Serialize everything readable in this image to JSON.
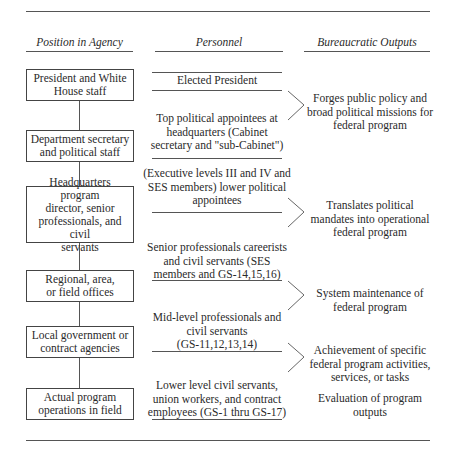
{
  "headers": {
    "position": "Position in Agency",
    "personnel": "Personnel",
    "outputs": "Bureaucratic Outputs"
  },
  "positions": [
    {
      "line1": "President and White",
      "line2": "House staff"
    },
    {
      "line1": "Department secretary",
      "line2": "and political staff"
    },
    {
      "line1": "Headquarters program",
      "line2": "director, senior",
      "line3": "professionals, and civil",
      "line4": "servants"
    },
    {
      "line1": "Regional, area,",
      "line2": "or field offices"
    },
    {
      "line1": "Local government or",
      "line2": "contract agencies"
    },
    {
      "line1": "Actual program",
      "line2": "operations in field"
    }
  ],
  "personnel": [
    {
      "line1": "Elected President"
    },
    {
      "line1": "Top political appointees at",
      "line2": "headquarters (Cabinet",
      "line3": "secretary and \"sub-Cabinet\")"
    },
    {
      "line1": "(Executive levels III and IV and",
      "line2": "SES members) lower political",
      "line3": "appointees"
    },
    {
      "line1": "Senior professionals careerists",
      "line2": "and civil servants (SES",
      "line3": "members and GS-14,15,16)"
    },
    {
      "line1": "Mid-level professionals and",
      "line2": "civil servants",
      "line3": "(GS-11,12,13,14)"
    },
    {
      "line1": "Lower level civil servants,",
      "line2": "union workers, and contract",
      "line3": "employees (GS-1 thru GS-17)"
    }
  ],
  "outputs": [
    {
      "line1": "Forges public policy and",
      "line2": "broad political missions for",
      "line3": "federal program"
    },
    {
      "line1": "Translates political",
      "line2": "mandates into operational",
      "line3": "federal program"
    },
    {
      "line1": "System maintenance of",
      "line2": "federal program"
    },
    {
      "line1": "Achievement of specific",
      "line2": "federal program activities,",
      "line3": "services, or tasks"
    },
    {
      "line1": "Evaluation of program",
      "line2": "outputs"
    }
  ]
}
